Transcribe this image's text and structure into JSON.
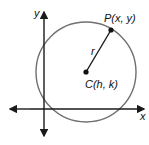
{
  "diagram": {
    "axes": {
      "x_label": "x",
      "y_label": "y"
    },
    "circle": {
      "center_label": "C(h, k)",
      "point_label": "P(x, y)",
      "radius_label": "r"
    },
    "colors": {
      "circle": "#707070",
      "axes": "#1a1a1a",
      "points": "#111111"
    }
  }
}
